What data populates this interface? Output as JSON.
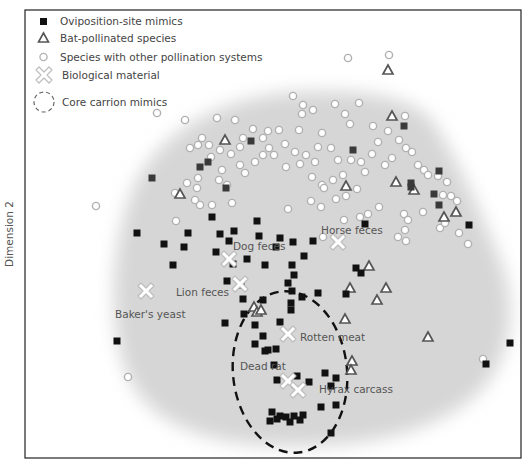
{
  "chart_data": {
    "type": "scatter",
    "title": "",
    "xlabel": "",
    "ylabel": "Dimension 2",
    "coordinate_system": "pixel-space estimates within plot frame (x: 25-521, y: 10-458)",
    "grid": false,
    "legend_position": "top-left inside plot",
    "legend": [
      {
        "label": "Oviposition-site mimics",
        "marker": "filled-square"
      },
      {
        "label": "Bat-pollinated species",
        "marker": "open-triangle"
      },
      {
        "label": "Species with other pollination systems",
        "marker": "open-circle"
      },
      {
        "label": "Biological material",
        "marker": "white-cross"
      },
      {
        "label": "Core carrion mimics",
        "marker": "dashed-ellipse"
      }
    ],
    "series": [
      {
        "name": "Oviposition-site mimics",
        "points": [
          [
            152,
            178
          ],
          [
            208,
            162
          ],
          [
            200,
            167
          ],
          [
            251,
            141
          ],
          [
            404,
            126
          ],
          [
            226,
            188
          ],
          [
            212,
            217
          ],
          [
            220,
            234
          ],
          [
            234,
            231
          ],
          [
            257,
            221
          ],
          [
            229,
            241
          ],
          [
            259,
            236
          ],
          [
            247,
            259
          ],
          [
            280,
            238
          ],
          [
            293,
            242
          ],
          [
            265,
            265
          ],
          [
            288,
            283
          ],
          [
            188,
            233
          ],
          [
            184,
            247
          ],
          [
            137,
            233
          ],
          [
            164,
            244
          ],
          [
            173,
            265
          ],
          [
            216,
            252
          ],
          [
            233,
            264
          ],
          [
            227,
            281
          ],
          [
            241,
            285
          ],
          [
            276,
            247
          ],
          [
            292,
            265
          ],
          [
            304,
            256
          ],
          [
            294,
            275
          ],
          [
            292,
            291
          ],
          [
            291,
            303
          ],
          [
            313,
            241
          ],
          [
            346,
            294
          ],
          [
            365,
            224
          ],
          [
            356,
            268
          ],
          [
            361,
            273
          ],
          [
            318,
            293
          ],
          [
            302,
            297
          ],
          [
            291,
            310
          ],
          [
            280,
            322
          ],
          [
            263,
            300
          ],
          [
            243,
            299
          ],
          [
            244,
            314
          ],
          [
            225,
            323
          ],
          [
            255,
            325
          ],
          [
            255,
            344
          ],
          [
            268,
            350
          ],
          [
            265,
            351
          ],
          [
            276,
            349
          ],
          [
            263,
            336
          ],
          [
            274,
            365
          ],
          [
            277,
            380
          ],
          [
            297,
            376
          ],
          [
            325,
            373
          ],
          [
            336,
            378
          ],
          [
            331,
            386
          ],
          [
            309,
            382
          ],
          [
            336,
            405
          ],
          [
            321,
            407
          ],
          [
            272,
            412
          ],
          [
            280,
            416
          ],
          [
            286,
            417
          ],
          [
            294,
            416
          ],
          [
            303,
            415
          ],
          [
            300,
            420
          ],
          [
            290,
            422
          ],
          [
            277,
            419
          ],
          [
            270,
            421
          ],
          [
            331,
            433
          ],
          [
            117,
            341
          ],
          [
            439,
            171
          ],
          [
            434,
            194
          ],
          [
            469,
            225
          ],
          [
            486,
            364
          ],
          [
            510,
            343
          ],
          [
            439,
            205
          ],
          [
            411,
            183
          ],
          [
            353,
            150
          ],
          [
            411,
            187
          ]
        ]
      },
      {
        "name": "Bat-pollinated species",
        "points": [
          [
            388,
            70
          ],
          [
            392,
            116
          ],
          [
            225,
            140
          ],
          [
            180,
            194
          ],
          [
            346,
            186
          ],
          [
            396,
            182
          ],
          [
            414,
            190
          ],
          [
            444,
            217
          ],
          [
            456,
            212
          ],
          [
            369,
            266
          ],
          [
            350,
            288
          ],
          [
            386,
            288
          ],
          [
            377,
            300
          ],
          [
            345,
            319
          ],
          [
            254,
            307
          ],
          [
            257,
            312
          ],
          [
            352,
            361
          ],
          [
            351,
            370
          ],
          [
            428,
            337
          ],
          [
            261,
            310
          ]
        ]
      },
      {
        "name": "Species with other pollination systems",
        "points": [
          [
            389,
            55
          ],
          [
            348,
            58
          ],
          [
            293,
            96
          ],
          [
            303,
            105
          ],
          [
            157,
            113
          ],
          [
            217,
            118
          ],
          [
            185,
            120
          ],
          [
            235,
            120
          ],
          [
            302,
            114
          ],
          [
            313,
            110
          ],
          [
            335,
            104
          ],
          [
            345,
            114
          ],
          [
            359,
            103
          ],
          [
            373,
            126
          ],
          [
            388,
            131
          ],
          [
            405,
            116
          ],
          [
            322,
            133
          ],
          [
            299,
            130
          ],
          [
            279,
            130
          ],
          [
            268,
            131
          ],
          [
            350,
            124
          ],
          [
            318,
            147
          ],
          [
            331,
            148
          ],
          [
            338,
            160
          ],
          [
            285,
            144
          ],
          [
            295,
            152
          ],
          [
            306,
            155
          ],
          [
            315,
            162
          ],
          [
            269,
            148
          ],
          [
            263,
            155
          ],
          [
            255,
            162
          ],
          [
            240,
            165
          ],
          [
            245,
            173
          ],
          [
            222,
            170
          ],
          [
            211,
            157
          ],
          [
            190,
            148
          ],
          [
            202,
            138
          ],
          [
            198,
            145
          ],
          [
            209,
            145
          ],
          [
            220,
            150
          ],
          [
            231,
            154
          ],
          [
            240,
            147
          ],
          [
            243,
            138
          ],
          [
            253,
            129
          ],
          [
            263,
            138
          ],
          [
            274,
            155
          ],
          [
            286,
            167
          ],
          [
            300,
            164
          ],
          [
            312,
            177
          ],
          [
            322,
            185
          ],
          [
            333,
            180
          ],
          [
            343,
            175
          ],
          [
            351,
            160
          ],
          [
            361,
            162
          ],
          [
            365,
            172
          ],
          [
            372,
            154
          ],
          [
            378,
            142
          ],
          [
            385,
            165
          ],
          [
            392,
            158
          ],
          [
            399,
            140
          ],
          [
            406,
            148
          ],
          [
            412,
            152
          ],
          [
            418,
            165
          ],
          [
            424,
            170
          ],
          [
            428,
            175
          ],
          [
            438,
            176
          ],
          [
            447,
            182
          ],
          [
            357,
            189
          ],
          [
            346,
            196
          ],
          [
            336,
            199
          ],
          [
            324,
            188
          ],
          [
            198,
            178
          ],
          [
            187,
            183
          ],
          [
            197,
            188
          ],
          [
            175,
            193
          ],
          [
            219,
            180
          ],
          [
            227,
            185
          ],
          [
            212,
            205
          ],
          [
            200,
            205
          ],
          [
            176,
            221
          ],
          [
            195,
            200
          ],
          [
            232,
            203
          ],
          [
            288,
            209
          ],
          [
            311,
            201
          ],
          [
            321,
            207
          ],
          [
            344,
            220
          ],
          [
            360,
            217
          ],
          [
            368,
            214
          ],
          [
            379,
            207
          ],
          [
            404,
            214
          ],
          [
            408,
            220
          ],
          [
            405,
            230
          ],
          [
            398,
            237
          ],
          [
            440,
            228
          ],
          [
            445,
            223
          ],
          [
            459,
            233
          ],
          [
            468,
            244
          ],
          [
            96,
            206
          ],
          [
            128,
            377
          ],
          [
            483,
            359
          ],
          [
            323,
            237
          ],
          [
            406,
            241
          ],
          [
            443,
            195
          ],
          [
            451,
            196
          ],
          [
            457,
            201
          ],
          [
            423,
            212
          ]
        ]
      },
      {
        "name": "Biological material",
        "points": [
          {
            "x": 146,
            "y": 291,
            "label": "Baker's yeast"
          },
          {
            "x": 229,
            "y": 259,
            "label": "Dog feces"
          },
          {
            "x": 240,
            "y": 284,
            "label": "Lion feces"
          },
          {
            "x": 338,
            "y": 242,
            "label": "Horse feces"
          },
          {
            "x": 288,
            "y": 334,
            "label": "Rotten meat"
          },
          {
            "x": 288,
            "y": 381,
            "label": "Dead rat"
          },
          {
            "x": 298,
            "y": 390,
            "label": "Hyrax carcass"
          }
        ]
      }
    ],
    "annotations": [
      {
        "text": "Baker's yeast",
        "x": 115,
        "y": 318
      },
      {
        "text": "Dog feces",
        "x": 233,
        "y": 250
      },
      {
        "text": "Lion feces",
        "x": 176,
        "y": 296
      },
      {
        "text": "Horse feces",
        "x": 321,
        "y": 234
      },
      {
        "text": "Rotten meat",
        "x": 300,
        "y": 341
      },
      {
        "text": "Dead rat",
        "x": 240,
        "y": 370
      },
      {
        "text": "Hyrax carcass",
        "x": 319,
        "y": 393
      }
    ],
    "core_region": {
      "label": "Core carrion mimics",
      "cx": 290,
      "cy": 372,
      "rx": 57,
      "ry": 81,
      "rotation": -6
    }
  },
  "colors": {
    "square": "#111111",
    "square_upper": "#3a3a3a",
    "triangle_stroke": "#555555",
    "circle_stroke": "#b0b0b0",
    "cross_fill": "#ffffff",
    "cross_stroke": "#bdbdbd",
    "blob": "#d6d6d6",
    "frame": "#222222"
  }
}
